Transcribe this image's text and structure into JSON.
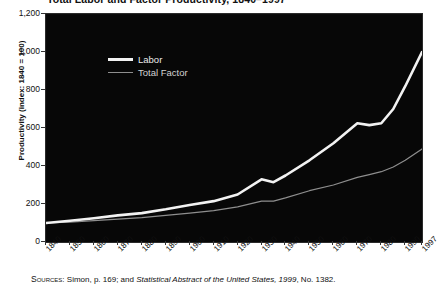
{
  "title": "Total Labor and Factor Productivity, 1840–1997",
  "y_axis": {
    "label": "Productivity (index: 1840 = 100)",
    "ticks": [
      "1,200",
      "1,000",
      "800",
      "600",
      "400",
      "200",
      "0"
    ]
  },
  "x_axis": {
    "ticks": [
      "1840",
      "1850",
      "1860",
      "1870",
      "1880",
      "1890",
      "1900",
      "1910",
      "1920",
      "1930",
      "1940",
      "1950",
      "1960",
      "1970",
      "1980",
      "1990",
      "1997"
    ]
  },
  "legend": {
    "labor": "Labor",
    "total_factor": "Total Factor"
  },
  "source": {
    "prefix": "Sources",
    "mid": ": Simon, p. 169; and ",
    "italic": "Statistical Abstract of the United States, 1999",
    "suffix": ", No. 1382."
  },
  "colors": {
    "background": "#070707",
    "labor": "#f2f2f2",
    "total_factor": "#8e8e8e",
    "page": "#ffffff",
    "text": "#111111"
  },
  "chart_data": {
    "type": "line",
    "title": "Total Labor and Factor Productivity, 1840–1997",
    "xlabel": "",
    "ylabel": "Productivity (index: 1840 = 100)",
    "xlim": [
      1840,
      1997
    ],
    "ylim": [
      0,
      1200
    ],
    "yticks": [
      0,
      200,
      400,
      600,
      800,
      1000,
      1200
    ],
    "xticks": [
      1840,
      1850,
      1860,
      1870,
      1880,
      1890,
      1900,
      1910,
      1920,
      1930,
      1940,
      1950,
      1960,
      1970,
      1980,
      1990,
      1997
    ],
    "grid": false,
    "legend_position": "upper-left-inside",
    "x": [
      1840,
      1850,
      1860,
      1870,
      1880,
      1890,
      1900,
      1910,
      1920,
      1930,
      1935,
      1940,
      1950,
      1960,
      1970,
      1975,
      1980,
      1985,
      1990,
      1997
    ],
    "series": [
      {
        "name": "Labor",
        "style": "thick-white",
        "values": [
          100,
          112,
          125,
          140,
          152,
          172,
          195,
          215,
          250,
          330,
          315,
          350,
          430,
          520,
          625,
          615,
          625,
          700,
          820,
          1000
        ]
      },
      {
        "name": "Total Factor",
        "style": "thin-gray",
        "values": [
          100,
          105,
          112,
          120,
          128,
          140,
          152,
          165,
          185,
          215,
          215,
          232,
          270,
          300,
          340,
          355,
          370,
          395,
          430,
          490
        ]
      }
    ]
  }
}
